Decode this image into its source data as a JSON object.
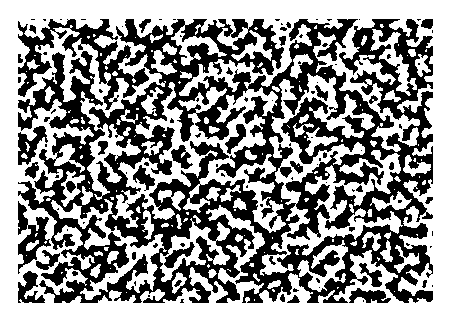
{
  "image": {
    "description": "Labyrinthine black-and-white stripe pattern (maze-like domain texture)",
    "colors": {
      "foreground": "#000000",
      "background": "#ffffff",
      "page": "#ffffff"
    },
    "pattern": {
      "type": "labyrinth",
      "approx_stripe_period_px": 9,
      "region": {
        "x": 18,
        "y": 19,
        "width": 415,
        "height": 284
      }
    }
  }
}
